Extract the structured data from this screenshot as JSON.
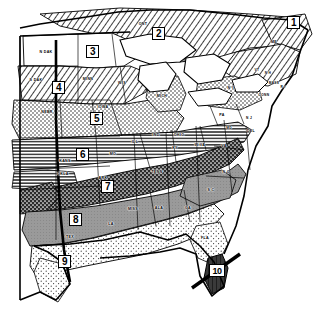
{
  "figure": {
    "kind": "thematic-map",
    "background_color": "#ffffff",
    "ink_color": "#000000"
  },
  "zones": [
    {
      "id": "1",
      "label": "1",
      "x": 293,
      "y": 22,
      "pattern": "diagonal-hatch",
      "fill": "#ffffff"
    },
    {
      "id": "2",
      "label": "2",
      "x": 158,
      "y": 33,
      "pattern": "diagonal-hatch",
      "fill": "#ffffff"
    },
    {
      "id": "3",
      "label": "3",
      "x": 92,
      "y": 51,
      "pattern": "blank-white",
      "fill": "#ffffff"
    },
    {
      "id": "4",
      "label": "4",
      "x": 58,
      "y": 87,
      "pattern": "diagonal-hatch",
      "fill": "#ffffff"
    },
    {
      "id": "5",
      "label": "5",
      "x": 96,
      "y": 118,
      "pattern": "fine-stipple",
      "fill": "#efefef"
    },
    {
      "id": "6",
      "label": "6",
      "x": 82,
      "y": 154,
      "pattern": "horizontal-lines",
      "fill": "#e6e6e6"
    },
    {
      "id": "7",
      "label": "7",
      "x": 107,
      "y": 186,
      "pattern": "dark-cross-stipple",
      "fill": "#4a4a4a"
    },
    {
      "id": "8",
      "label": "8",
      "x": 75,
      "y": 219,
      "pattern": "medium-gray",
      "fill": "#9a9a9a"
    },
    {
      "id": "9",
      "label": "9",
      "x": 64,
      "y": 261,
      "pattern": "light-stipple",
      "fill": "#e2e2e2"
    },
    {
      "id": "10",
      "label": "10",
      "x": 217,
      "y": 270,
      "pattern": "dark-solid",
      "fill": "#3a3a3a"
    }
  ],
  "state_labels": [
    {
      "text": "ONT",
      "x": 143,
      "y": 24
    },
    {
      "text": "N DAK",
      "x": 46,
      "y": 52
    },
    {
      "text": "S DAK",
      "x": 36,
      "y": 80
    },
    {
      "text": "MINN",
      "x": 88,
      "y": 79
    },
    {
      "text": "WIS",
      "x": 122,
      "y": 83
    },
    {
      "text": "MICH",
      "x": 162,
      "y": 96
    },
    {
      "text": "ME",
      "x": 274,
      "y": 42
    },
    {
      "text": "N H",
      "x": 268,
      "y": 73
    },
    {
      "text": "VT",
      "x": 257,
      "y": 70
    },
    {
      "text": "N Y",
      "x": 231,
      "y": 88
    },
    {
      "text": "MASS",
      "x": 274,
      "y": 83
    },
    {
      "text": "R I",
      "x": 281,
      "y": 87
    },
    {
      "text": "CONN",
      "x": 264,
      "y": 95
    },
    {
      "text": "NEBR",
      "x": 47,
      "y": 112
    },
    {
      "text": "IOWA",
      "x": 103,
      "y": 107
    },
    {
      "text": "PA",
      "x": 222,
      "y": 115
    },
    {
      "text": "N J",
      "x": 249,
      "y": 118
    },
    {
      "text": "DEL",
      "x": 250,
      "y": 131
    },
    {
      "text": "MD",
      "x": 229,
      "y": 128
    },
    {
      "text": "ILL",
      "x": 135,
      "y": 142
    },
    {
      "text": "IND",
      "x": 156,
      "y": 135
    },
    {
      "text": "OHIO",
      "x": 179,
      "y": 135
    },
    {
      "text": "W VA",
      "x": 200,
      "y": 145
    },
    {
      "text": "KY",
      "x": 175,
      "y": 148
    },
    {
      "text": "VA",
      "x": 224,
      "y": 146
    },
    {
      "text": "KANS",
      "x": 65,
      "y": 161
    },
    {
      "text": "MO",
      "x": 113,
      "y": 154
    },
    {
      "text": "OKLA",
      "x": 63,
      "y": 174
    },
    {
      "text": "ARK",
      "x": 103,
      "y": 178
    },
    {
      "text": "TENN",
      "x": 157,
      "y": 172
    },
    {
      "text": "N C",
      "x": 226,
      "y": 172
    },
    {
      "text": "S C",
      "x": 211,
      "y": 190
    },
    {
      "text": "MISS",
      "x": 133,
      "y": 209
    },
    {
      "text": "ALA",
      "x": 159,
      "y": 208
    },
    {
      "text": "GA",
      "x": 188,
      "y": 208
    },
    {
      "text": "LA",
      "x": 111,
      "y": 224
    },
    {
      "text": "TEX",
      "x": 70,
      "y": 237
    },
    {
      "text": "FLA",
      "x": 205,
      "y": 238
    }
  ]
}
